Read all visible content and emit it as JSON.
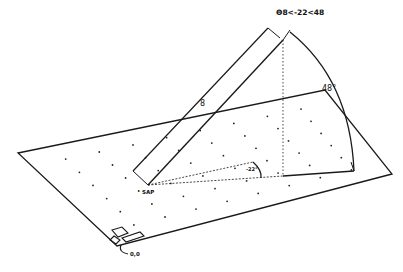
{
  "diagram": {
    "type": "3d-geometry",
    "title_label": "Θ8<-22<48",
    "distance_label": "8",
    "elevation_angle_label": "48°",
    "azimuth_angle_label": "-22°",
    "origin_label": "SAP",
    "device_label": "0,0",
    "colors": {
      "line": "#1a1a1a",
      "background": "#ffffff"
    }
  }
}
